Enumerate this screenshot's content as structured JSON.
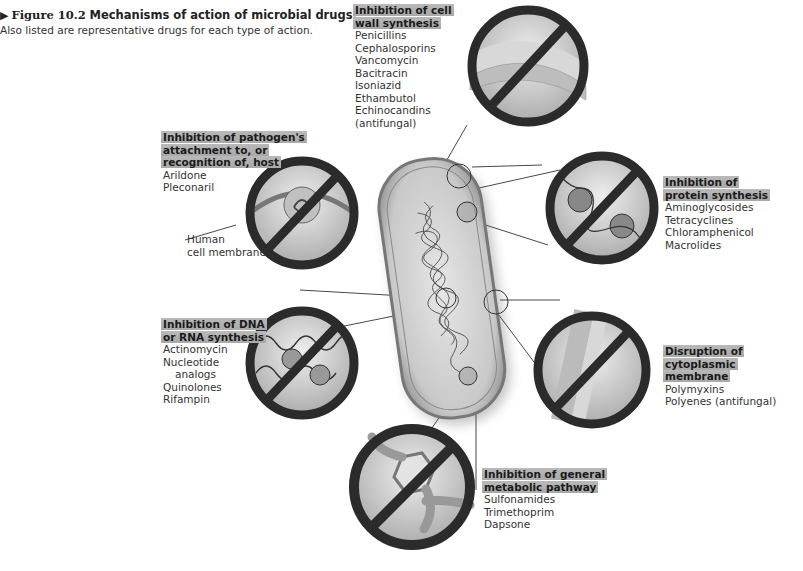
{
  "caption": {
    "figure_number": "Figure 10.2",
    "title": "Mechanisms of action of microbial drugs.",
    "subtitle": "Also listed are representative drugs for each type of action."
  },
  "mechanisms": [
    {
      "id": "cell-wall",
      "heading_lines": [
        "Inhibition of cell",
        "wall synthesis"
      ],
      "drugs": [
        "Penicillins",
        "Cephalosporins",
        "Vancomycin",
        "Bacitracin",
        "Isoniazid",
        "Ethambutol",
        "Echinocandins",
        "(antifungal)"
      ]
    },
    {
      "id": "attachment",
      "heading_lines": [
        "Inhibition of pathogen's",
        "attachment to, or",
        "recognition of, host"
      ],
      "drugs": [
        "Arildone",
        "Pleconaril"
      ]
    },
    {
      "id": "protein-synthesis",
      "heading_lines": [
        "Inhibition of",
        "protein synthesis"
      ],
      "drugs": [
        "Aminoglycosides",
        "Tetracyclines",
        "Chloramphenicol",
        "Macrolides"
      ]
    },
    {
      "id": "nucleic-acid",
      "heading_lines": [
        "Inhibition of DNA",
        "or RNA synthesis"
      ],
      "drugs": [
        "Actinomycin",
        "Nucleotide",
        "analogs",
        "Quinolones",
        "Rifampin"
      ]
    },
    {
      "id": "membrane",
      "heading_lines": [
        "Disruption of",
        "cytoplasmic membrane"
      ],
      "drugs": [
        "Polymyxins",
        "Polyenes (antifungal)"
      ]
    },
    {
      "id": "metabolic",
      "heading_lines": [
        "Inhibition of general",
        "metabolic pathway"
      ],
      "drugs": [
        "Sulfonamides",
        "Trimethoprim",
        "Dapsone"
      ]
    }
  ],
  "annotations": {
    "human_cell_membrane": [
      "Human",
      "cell membrane"
    ]
  },
  "colors": {
    "prohibition_ring": "#2b2b2b",
    "heading_highlight": "#b0b0b0",
    "cell_fill": "#d6d6d6"
  }
}
